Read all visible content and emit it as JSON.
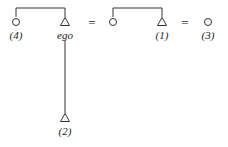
{
  "diagram": {
    "type": "kinship",
    "nodes": [
      {
        "id": "n4",
        "shape": "circle",
        "label": "(4)",
        "x": 16,
        "y": 22
      },
      {
        "id": "ego",
        "shape": "triangle",
        "label": "ego",
        "x": 65,
        "y": 22
      },
      {
        "id": "nw",
        "shape": "circle",
        "label": "",
        "x": 113,
        "y": 22
      },
      {
        "id": "n1",
        "shape": "triangle",
        "label": "(1)",
        "x": 162,
        "y": 22
      },
      {
        "id": "n3",
        "shape": "circle",
        "label": "(3)",
        "x": 208,
        "y": 22
      },
      {
        "id": "n2",
        "shape": "triangle",
        "label": "(2)",
        "x": 65,
        "y": 118
      }
    ],
    "equals": [
      "=",
      "="
    ],
    "colors": {
      "stroke": "#333333",
      "background": "#ffffff"
    }
  }
}
